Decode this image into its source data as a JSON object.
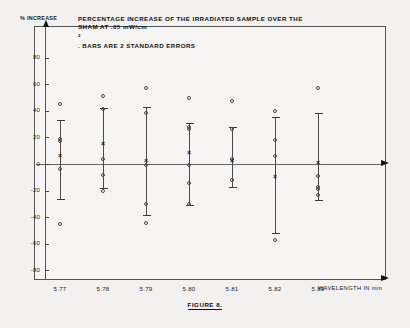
{
  "figure": {
    "title_line1": "PERCENTAGE INCREASE OF THE IRRADIATED SAMPLE OVER THE",
    "title_line2_a": "SHAM AT .05 mW/cm",
    "title_line2_sup": "2",
    "title_line2_b": ". BARS ARE 2 STANDARD ERRORS",
    "caption": "FIGURE 8.",
    "y_axis_label": "% INCREASE",
    "x_axis_label": "WAVELENGTH IN mm"
  },
  "chart_data": {
    "type": "scatter",
    "title": "PERCENTAGE INCREASE OF THE IRRADIATED SAMPLE OVER THE SHAM AT .05 mW/cm2. BARS ARE 2 STANDARD ERRORS",
    "xlabel": "WAVELENGTH IN mm",
    "ylabel": "% INCREASE",
    "ylim": [
      -90,
      85
    ],
    "yticks": [
      80,
      60,
      40,
      20,
      0,
      -20,
      -40,
      -60,
      -80
    ],
    "ytick_labels": [
      "80",
      "60",
      "40",
      "20",
      "0",
      "-20",
      "-40",
      "-60",
      "-80"
    ],
    "categories": [
      "5.77",
      "5.78",
      "5.79",
      "5.80",
      "5.81",
      "5.82",
      "5.83"
    ],
    "grid": false,
    "legend": "none",
    "error_bar_meaning": "2 standard errors",
    "groups": [
      {
        "x_label": "5.77",
        "mean": 6,
        "err_low": -26,
        "err_high": 33,
        "points": [
          45,
          19,
          17,
          -4,
          -45
        ]
      },
      {
        "x_label": "5.78",
        "mean": 15,
        "err_low": -18,
        "err_high": 42,
        "points": [
          51,
          41,
          4,
          -8,
          -20
        ]
      },
      {
        "x_label": "5.79",
        "mean": 2,
        "err_low": -38,
        "err_high": 43,
        "points": [
          57,
          38,
          -1,
          -30,
          -44
        ]
      },
      {
        "x_label": "5.80",
        "mean": 8,
        "err_low": -31,
        "err_high": 31,
        "points": [
          50,
          28,
          26,
          -1,
          -14,
          -30
        ]
      },
      {
        "x_label": "5.81",
        "mean": 2,
        "err_low": -17,
        "err_high": 28,
        "points": [
          47,
          26,
          4,
          -12
        ]
      },
      {
        "x_label": "5.82",
        "mean": -10,
        "err_low": -52,
        "err_high": 35,
        "points": [
          40,
          18,
          6,
          -57
        ]
      },
      {
        "x_label": "5.83",
        "mean": 1,
        "err_low": -27,
        "err_high": 38,
        "points": [
          57,
          -9,
          -17,
          -19,
          -23
        ]
      }
    ]
  }
}
